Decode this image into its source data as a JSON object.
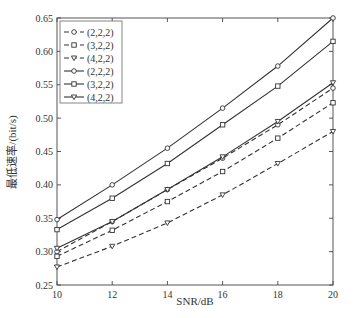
{
  "chart_data": {
    "type": "line",
    "title": "",
    "xlabel": "SNR/dB",
    "ylabel": "最低速率/(bit/s)",
    "xlim": [
      10,
      20
    ],
    "ylim": [
      0.25,
      0.65
    ],
    "xticks": [
      10,
      12,
      14,
      16,
      18,
      20
    ],
    "yticks": [
      0.25,
      0.3,
      0.35,
      0.4,
      0.45,
      0.5,
      0.55,
      0.6,
      0.65
    ],
    "grid": false,
    "legend_position": "upper left",
    "x": [
      10,
      12,
      14,
      16,
      18,
      20
    ],
    "series": [
      {
        "name": "(2,2,2)",
        "style": "dashed",
        "marker": "circle",
        "values": [
          0.3,
          0.345,
          0.393,
          0.44,
          0.49,
          0.545
        ]
      },
      {
        "name": "(3,2,2)",
        "style": "dashed",
        "marker": "square",
        "values": [
          0.293,
          0.332,
          0.375,
          0.42,
          0.47,
          0.523
        ]
      },
      {
        "name": "(4,2,2)",
        "style": "dashed",
        "marker": "triangle-down",
        "values": [
          0.277,
          0.308,
          0.343,
          0.385,
          0.432,
          0.48
        ]
      },
      {
        "name": "(2,2,2)",
        "style": "solid",
        "marker": "circle",
        "values": [
          0.348,
          0.4,
          0.455,
          0.515,
          0.578,
          0.65
        ]
      },
      {
        "name": "(3,2,2)",
        "style": "solid",
        "marker": "square",
        "values": [
          0.333,
          0.38,
          0.432,
          0.49,
          0.548,
          0.615
        ]
      },
      {
        "name": "(4,2,2)",
        "style": "solid",
        "marker": "triangle-down",
        "values": [
          0.305,
          0.345,
          0.393,
          0.442,
          0.495,
          0.553
        ]
      }
    ]
  }
}
